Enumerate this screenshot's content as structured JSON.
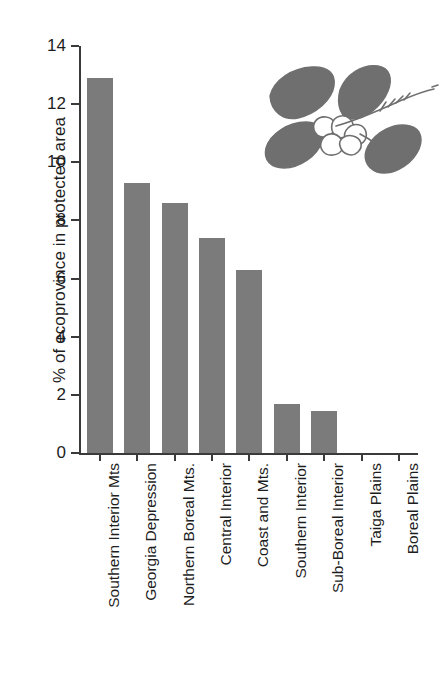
{
  "chart_data": {
    "type": "bar",
    "title": "",
    "subtitle": "",
    "xlabel": "",
    "ylabel": "% of ecoprovince in protected area",
    "ylim": [
      0,
      14
    ],
    "ytick_values": [
      0,
      2,
      4,
      6,
      8,
      10,
      12,
      14
    ],
    "ytick_labels": [
      "0",
      "2",
      "4",
      "6",
      "8",
      "10",
      "12",
      "14"
    ],
    "grid": false,
    "legend": null,
    "bar_color": "#7b7b7b",
    "axis_color": "#3a3a3a",
    "background_color": "#ffffff",
    "categories": [
      "Southern Interior Mts",
      "Georgia Depression",
      "Northern Boreal Mts.",
      "Central Interior",
      "Coast and Mts.",
      "Southern Interior",
      "Sub-Boreal Interior",
      "Taiga Plains",
      "Boreal Plains"
    ],
    "values": [
      12.9,
      9.3,
      8.6,
      7.4,
      6.3,
      1.7,
      1.45,
      0,
      0
    ],
    "annotations": [
      {
        "name": "plant-illustration",
        "description": "black-and-white botanical line drawing of a leafy sprig with flowers"
      }
    ]
  }
}
